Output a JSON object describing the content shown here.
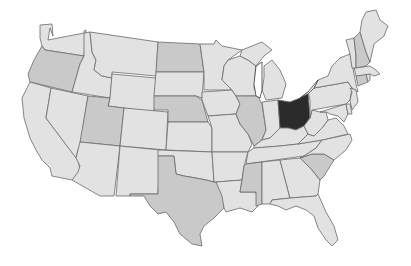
{
  "map": {
    "title": "",
    "highlighted_state": "Ohio",
    "colors": {
      "background": "#ffffff",
      "light": "#e2e2e2",
      "medium": "#c9c9c9",
      "highlight": "#2b2b2b",
      "border": "#6a6a6a"
    },
    "states": [
      {
        "id": "WA",
        "name": "Washington",
        "shade": "light"
      },
      {
        "id": "OR",
        "name": "Oregon",
        "shade": "medium"
      },
      {
        "id": "CA",
        "name": "California",
        "shade": "light"
      },
      {
        "id": "ID",
        "name": "Idaho",
        "shade": "light"
      },
      {
        "id": "NV",
        "name": "Nevada",
        "shade": "light"
      },
      {
        "id": "MT",
        "name": "Montana",
        "shade": "light"
      },
      {
        "id": "WY",
        "name": "Wyoming",
        "shade": "light"
      },
      {
        "id": "UT",
        "name": "Utah",
        "shade": "medium"
      },
      {
        "id": "AZ",
        "name": "Arizona",
        "shade": "light"
      },
      {
        "id": "CO",
        "name": "Colorado",
        "shade": "light"
      },
      {
        "id": "NM",
        "name": "New Mexico",
        "shade": "light"
      },
      {
        "id": "ND",
        "name": "North Dakota",
        "shade": "medium"
      },
      {
        "id": "SD",
        "name": "South Dakota",
        "shade": "light"
      },
      {
        "id": "NE",
        "name": "Nebraska",
        "shade": "medium"
      },
      {
        "id": "KS",
        "name": "Kansas",
        "shade": "light"
      },
      {
        "id": "OK",
        "name": "Oklahoma",
        "shade": "light"
      },
      {
        "id": "TX",
        "name": "Texas",
        "shade": "medium"
      },
      {
        "id": "MN",
        "name": "Minnesota",
        "shade": "light"
      },
      {
        "id": "IA",
        "name": "Iowa",
        "shade": "light"
      },
      {
        "id": "MO",
        "name": "Missouri",
        "shade": "light"
      },
      {
        "id": "AR",
        "name": "Arkansas",
        "shade": "light"
      },
      {
        "id": "LA",
        "name": "Louisiana",
        "shade": "light"
      },
      {
        "id": "WI",
        "name": "Wisconsin",
        "shade": "light"
      },
      {
        "id": "IL",
        "name": "Illinois",
        "shade": "medium"
      },
      {
        "id": "MI",
        "name": "Michigan",
        "shade": "light"
      },
      {
        "id": "IN",
        "name": "Indiana",
        "shade": "light"
      },
      {
        "id": "OH",
        "name": "Ohio",
        "shade": "highlight"
      },
      {
        "id": "KY",
        "name": "Kentucky",
        "shade": "light"
      },
      {
        "id": "TN",
        "name": "Tennessee",
        "shade": "light"
      },
      {
        "id": "MS",
        "name": "Mississippi",
        "shade": "medium"
      },
      {
        "id": "AL",
        "name": "Alabama",
        "shade": "light"
      },
      {
        "id": "GA",
        "name": "Georgia",
        "shade": "light"
      },
      {
        "id": "FL",
        "name": "Florida",
        "shade": "light"
      },
      {
        "id": "SC",
        "name": "South Carolina",
        "shade": "medium"
      },
      {
        "id": "NC",
        "name": "North Carolina",
        "shade": "light"
      },
      {
        "id": "VA",
        "name": "Virginia",
        "shade": "light"
      },
      {
        "id": "WV",
        "name": "West Virginia",
        "shade": "light"
      },
      {
        "id": "PA",
        "name": "Pennsylvania",
        "shade": "light"
      },
      {
        "id": "NY",
        "name": "New York",
        "shade": "light"
      },
      {
        "id": "MD",
        "name": "Maryland",
        "shade": "light"
      },
      {
        "id": "DE",
        "name": "Delaware",
        "shade": "light"
      },
      {
        "id": "NJ",
        "name": "New Jersey",
        "shade": "light"
      },
      {
        "id": "CT",
        "name": "Connecticut",
        "shade": "medium"
      },
      {
        "id": "RI",
        "name": "Rhode Island",
        "shade": "light"
      },
      {
        "id": "MA",
        "name": "Massachusetts",
        "shade": "light"
      },
      {
        "id": "VT",
        "name": "Vermont",
        "shade": "light"
      },
      {
        "id": "NH",
        "name": "New Hampshire",
        "shade": "medium"
      },
      {
        "id": "ME",
        "name": "Maine",
        "shade": "light"
      }
    ]
  }
}
